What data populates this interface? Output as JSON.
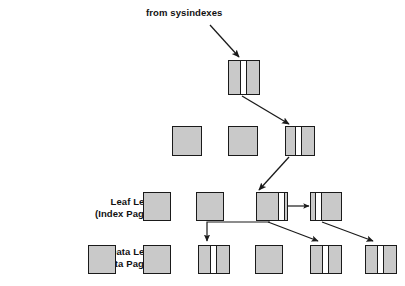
{
  "diagram": {
    "title": "from sysindexes",
    "title_position": {
      "x": 146,
      "y": 7
    },
    "background_color": "#ffffff",
    "node_fill_color": "#c9c9c9",
    "node_border_color": "#1a1a1a",
    "pointer_cell_color": "#ffffff",
    "arrow_color": "#1a1a1a",
    "levels": [
      {
        "name": "root-level",
        "label": "",
        "label_line2": "",
        "nodes": [
          {
            "id": "root-node",
            "x": 228,
            "y": 60,
            "w": 32,
            "h": 35,
            "pointer": true,
            "pointer_offset": 11,
            "pointer_width": 5
          }
        ]
      },
      {
        "name": "intermediate-level",
        "label": "",
        "label_line2": "",
        "nodes": [
          {
            "id": "intermediate-node-1",
            "x": 172,
            "y": 126,
            "w": 30,
            "h": 30,
            "pointer": false,
            "pointer_offset": 0,
            "pointer_width": 0
          },
          {
            "id": "intermediate-node-2",
            "x": 228,
            "y": 126,
            "w": 30,
            "h": 30,
            "pointer": false,
            "pointer_offset": 0,
            "pointer_width": 0
          },
          {
            "id": "intermediate-node-3",
            "x": 285,
            "y": 126,
            "w": 30,
            "h": 30,
            "pointer": true,
            "pointer_offset": 9,
            "pointer_width": 5
          }
        ]
      },
      {
        "name": "leaf-level",
        "label": "Leaf Level",
        "label_line2": "(Index Pages)",
        "label_position": {
          "x": 48,
          "y": 196
        },
        "nodes": [
          {
            "id": "leaf-node-1",
            "x": 143,
            "y": 192,
            "w": 28,
            "h": 29,
            "pointer": false,
            "pointer_offset": 0,
            "pointer_width": 0
          },
          {
            "id": "leaf-node-2",
            "x": 196,
            "y": 192,
            "w": 28,
            "h": 29,
            "pointer": false,
            "pointer_offset": 0,
            "pointer_width": 0
          },
          {
            "id": "leaf-node-3",
            "x": 256,
            "y": 192,
            "w": 32,
            "h": 29,
            "pointer": true,
            "pointer_offset": 21,
            "pointer_width": 5
          },
          {
            "id": "leaf-node-4",
            "x": 310,
            "y": 192,
            "w": 32,
            "h": 29,
            "pointer": true,
            "pointer_offset": 4,
            "pointer_width": 5
          }
        ]
      },
      {
        "name": "data-level",
        "label": "Data Level",
        "label_line2": "(Data Pages)",
        "label_position": {
          "x": 45,
          "y": 246
        },
        "nodes": [
          {
            "id": "data-node-1",
            "x": 88,
            "y": 245,
            "w": 28,
            "h": 29,
            "pointer": false,
            "pointer_offset": 0,
            "pointer_width": 0
          },
          {
            "id": "data-node-2",
            "x": 143,
            "y": 245,
            "w": 28,
            "h": 29,
            "pointer": false,
            "pointer_offset": 0,
            "pointer_width": 0
          },
          {
            "id": "data-node-3",
            "x": 198,
            "y": 245,
            "w": 32,
            "h": 29,
            "pointer": true,
            "pointer_offset": 11,
            "pointer_width": 5
          },
          {
            "id": "data-node-4",
            "x": 255,
            "y": 245,
            "w": 28,
            "h": 29,
            "pointer": false,
            "pointer_offset": 0,
            "pointer_width": 0
          },
          {
            "id": "data-node-5",
            "x": 310,
            "y": 245,
            "w": 32,
            "h": 29,
            "pointer": true,
            "pointer_offset": 11,
            "pointer_width": 5
          },
          {
            "id": "data-node-6",
            "x": 365,
            "y": 245,
            "w": 32,
            "h": 29,
            "pointer": true,
            "pointer_offset": 11,
            "pointer_width": 5
          }
        ]
      }
    ],
    "connectors": [
      {
        "id": "sysindexes-to-root",
        "type": "diagonal",
        "from": [
          210,
          25
        ],
        "to": [
          238,
          56
        ]
      },
      {
        "id": "root-to-intermediate",
        "type": "diagonal",
        "from": [
          242,
          96
        ],
        "to": [
          288,
          124
        ]
      },
      {
        "id": "intermediate-to-leaf",
        "type": "diagonal",
        "from": [
          288,
          157
        ],
        "to": [
          259,
          190
        ]
      },
      {
        "id": "leaf-sibling-link",
        "type": "horizontal",
        "from": [
          289,
          206
        ],
        "to": [
          309,
          206
        ]
      },
      {
        "id": "leaf3-to-data3",
        "type": "elbow",
        "from": [
          268,
          224
        ],
        "to": [
          207,
          243
        ]
      },
      {
        "id": "leaf3-to-data5",
        "type": "diagonal",
        "from": [
          272,
          224
        ],
        "to": [
          318,
          242
        ]
      },
      {
        "id": "leaf4-to-data6",
        "type": "diagonal",
        "from": [
          323,
          224
        ],
        "to": [
          373,
          242
        ]
      }
    ]
  }
}
